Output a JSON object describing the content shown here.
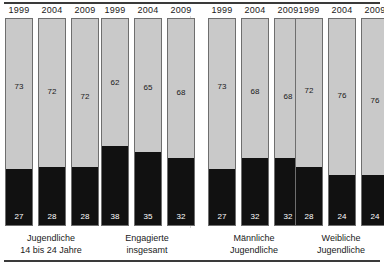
{
  "chart_data": {
    "type": "bar",
    "subtype": "100% stacked column",
    "title": "",
    "subtitle": "",
    "xlabel": "",
    "ylabel": "",
    "ylim": [
      0,
      100
    ],
    "unit": "%",
    "grid": false,
    "legend_position": "none",
    "categories": [
      "1999",
      "2004",
      "2009"
    ],
    "series": [
      {
        "name": "lower-segment-black",
        "color": "#111111"
      },
      {
        "name": "upper-segment-gray",
        "color": "#c9c9c9"
      }
    ],
    "groups": [
      {
        "caption_line1": "Jugendliche",
        "caption_line2": "14 bis 24 Jahre",
        "bars": [
          {
            "category": "1999",
            "top": 73,
            "bottom": 27
          },
          {
            "category": "2004",
            "top": 72,
            "bottom": 28
          },
          {
            "category": "2009",
            "top": 72,
            "bottom": 28
          }
        ]
      },
      {
        "caption_line1": "Engagierte",
        "caption_line2": "insgesamt",
        "bars": [
          {
            "category": "1999",
            "top": 62,
            "bottom": 38
          },
          {
            "category": "2004",
            "top": 65,
            "bottom": 35
          },
          {
            "category": "2009",
            "top": 68,
            "bottom": 32
          }
        ]
      },
      {
        "caption_line1": "Männliche",
        "caption_line2": "Jugendliche",
        "bars": [
          {
            "category": "1999",
            "top": 73,
            "bottom": 27
          },
          {
            "category": "2004",
            "top": 68,
            "bottom": 32
          },
          {
            "category": "2009",
            "top": 68,
            "bottom": 32
          }
        ]
      },
      {
        "caption_line1": "Weibliche",
        "caption_line2": "Jugendliche",
        "bars": [
          {
            "category": "1999",
            "top": 72,
            "bottom": 28
          },
          {
            "category": "2004",
            "top": 76,
            "bottom": 24
          },
          {
            "category": "2009",
            "top": 76,
            "bottom": 24
          }
        ]
      }
    ]
  },
  "layout": {
    "bar_width": 28,
    "bar_gap": 5,
    "group_starts": [
      5,
      101,
      208,
      295
    ],
    "group_caption_centers": [
      51,
      147,
      254,
      341
    ],
    "divider_x": 190,
    "plot_top": 18,
    "plot_height": 208
  }
}
